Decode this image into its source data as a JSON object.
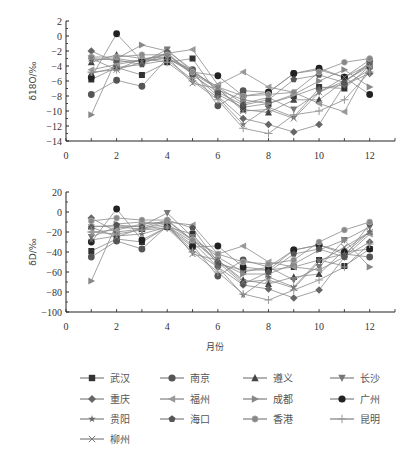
{
  "chart_data": [
    {
      "type": "line",
      "title": "",
      "xlabel": "",
      "ylabel": "δ18O/‰",
      "ylim": [
        -14,
        2
      ],
      "xlim": [
        0,
        13
      ],
      "yticks": [
        2,
        0,
        -2,
        -4,
        -6,
        -8,
        -10,
        -12,
        -14
      ],
      "xticks": [
        0,
        2,
        4,
        6,
        8,
        10,
        12
      ],
      "x": [
        1,
        2,
        3,
        4,
        5,
        6,
        7,
        8,
        9,
        10,
        11,
        12
      ],
      "series": [
        {
          "name": "武汉",
          "marker": "square",
          "color": "#333333",
          "values": [
            -5.8,
            -4.2,
            -5.2,
            -3.5,
            -3.0,
            -7.8,
            -9.5,
            -9.0,
            -8.0,
            -6.8,
            -7.0,
            -4.0
          ]
        },
        {
          "name": "南京",
          "marker": "circle",
          "color": "#555555",
          "values": [
            -7.8,
            -5.9,
            -6.7,
            -3.0,
            -4.5,
            -9.3,
            -7.3,
            -7.5,
            -5.0,
            -4.5,
            -5.5,
            -3.2
          ]
        },
        {
          "name": "遵义",
          "marker": "triangle-up",
          "color": "#444444",
          "values": [
            -3.5,
            -2.5,
            -3.0,
            -2.8,
            -5.0,
            -7.0,
            -9.8,
            -10.2,
            -8.5,
            -8.5,
            -6.0,
            -3.8
          ]
        },
        {
          "name": "长沙",
          "marker": "triangle-down",
          "color": "#777777",
          "values": [
            -3.2,
            -3.0,
            -3.5,
            -1.8,
            -4.8,
            -6.8,
            -9.0,
            -8.2,
            -9.8,
            -7.5,
            -6.0,
            -4.0
          ]
        },
        {
          "name": "重庆",
          "marker": "diamond",
          "color": "#666666",
          "values": [
            -2.0,
            -3.5,
            -3.2,
            -2.5,
            -5.0,
            -8.0,
            -11.0,
            -11.8,
            -12.8,
            -11.8,
            -6.5,
            -5.0
          ]
        },
        {
          "name": "福州",
          "marker": "triangle-left",
          "color": "#999999",
          "values": [
            -4.5,
            -3.8,
            -3.2,
            -2.3,
            -1.8,
            -6.5,
            -4.8,
            -6.8,
            -7.5,
            -9.0,
            -10.1,
            -4.0
          ]
        },
        {
          "name": "成都",
          "marker": "triangle-right",
          "color": "#888888",
          "values": [
            -10.5,
            -3.0,
            -1.2,
            -2.0,
            -4.5,
            -7.2,
            -8.5,
            -9.0,
            -7.8,
            -6.0,
            -4.5,
            -6.8
          ]
        },
        {
          "name": "广州",
          "marker": "circle",
          "color": "#222222",
          "values": [
            -5.5,
            0.3,
            -3.3,
            -3.0,
            -4.8,
            -5.3,
            -8.0,
            -7.5,
            -5.0,
            -4.3,
            -5.5,
            -7.8
          ]
        },
        {
          "name": "贵阳",
          "marker": "star",
          "color": "#666666",
          "values": [
            -5.0,
            -4.2,
            -3.8,
            -3.2,
            -5.8,
            -8.2,
            -11.8,
            -9.5,
            -10.8,
            -7.0,
            -6.5,
            -4.5
          ]
        },
        {
          "name": "海口",
          "marker": "pentagon",
          "color": "#555555",
          "values": [
            -3.0,
            -3.2,
            -3.8,
            -2.2,
            -5.2,
            -7.5,
            -9.2,
            -8.5,
            -5.8,
            -5.2,
            -6.2,
            -3.5
          ]
        },
        {
          "name": "香港",
          "marker": "circle-small",
          "color": "#888888",
          "values": [
            -2.8,
            -2.8,
            -2.5,
            -2.5,
            -4.8,
            -6.8,
            -8.0,
            -7.8,
            -7.5,
            -4.8,
            -3.5,
            -3.0
          ]
        },
        {
          "name": "昆明",
          "marker": "plus",
          "color": "#999999",
          "values": [
            -4.8,
            -4.5,
            -3.0,
            -3.5,
            -6.0,
            -8.5,
            -12.3,
            -13.0,
            -10.5,
            -10.0,
            -8.5,
            -4.8
          ]
        },
        {
          "name": "柳州",
          "marker": "x",
          "color": "#777777",
          "values": [
            -3.0,
            -4.5,
            -3.5,
            -2.8,
            -6.3,
            -7.0,
            -10.0,
            -9.8,
            -11.0,
            -7.5,
            -5.5,
            -3.8
          ]
        }
      ]
    },
    {
      "type": "line",
      "title": "",
      "xlabel": "月份",
      "ylabel": "δD/‰",
      "ylim": [
        -100,
        20
      ],
      "xlim": [
        0,
        13
      ],
      "yticks": [
        20,
        0,
        -20,
        -40,
        -60,
        -80,
        -100
      ],
      "xticks": [
        0,
        2,
        4,
        6,
        8,
        10,
        12
      ],
      "x": [
        1,
        2,
        3,
        4,
        5,
        6,
        7,
        8,
        9,
        10,
        11,
        12
      ],
      "series": [
        {
          "name": "武汉",
          "marker": "square",
          "color": "#333333",
          "values": [
            -39,
            -27,
            -30,
            -15,
            -22,
            -52,
            -58,
            -58,
            -55,
            -48,
            -54,
            -37
          ]
        },
        {
          "name": "南京",
          "marker": "circle",
          "color": "#555555",
          "values": [
            -45,
            -29,
            -37,
            -14,
            -33,
            -64,
            -48,
            -55,
            -38,
            -33,
            -42,
            -45
          ]
        },
        {
          "name": "遵义",
          "marker": "triangle-up",
          "color": "#444444",
          "values": [
            -14,
            -15,
            -17,
            -9,
            -28,
            -48,
            -68,
            -72,
            -65,
            -62,
            -38,
            -20
          ]
        },
        {
          "name": "长沙",
          "marker": "triangle-down",
          "color": "#777777",
          "values": [
            -25,
            -15,
            -14,
            -1,
            -25,
            -45,
            -60,
            -55,
            -68,
            -55,
            -28,
            -15
          ]
        },
        {
          "name": "重庆",
          "marker": "diamond",
          "color": "#666666",
          "values": [
            -6,
            -20,
            -17,
            -14,
            -30,
            -55,
            -73,
            -77,
            -86,
            -78,
            -45,
            -30
          ]
        },
        {
          "name": "福州",
          "marker": "triangle-left",
          "color": "#999999",
          "values": [
            -20,
            -18,
            -12,
            -10,
            -13,
            -42,
            -34,
            -50,
            -55,
            -58,
            -45,
            -22
          ]
        },
        {
          "name": "成都",
          "marker": "triangle-right",
          "color": "#888888",
          "values": [
            -69,
            -12,
            -10,
            -12,
            -28,
            -50,
            -62,
            -62,
            -52,
            -38,
            -28,
            -55
          ]
        },
        {
          "name": "广州",
          "marker": "circle",
          "color": "#222222",
          "values": [
            -30,
            3,
            -28,
            -15,
            -35,
            -34,
            -55,
            -58,
            -38,
            -33,
            -40,
            -37
          ]
        },
        {
          "name": "贵阳",
          "marker": "star",
          "color": "#666666",
          "values": [
            -28,
            -24,
            -22,
            -15,
            -38,
            -55,
            -83,
            -65,
            -75,
            -48,
            -42,
            -20
          ]
        },
        {
          "name": "海口",
          "marker": "pentagon",
          "color": "#555555",
          "values": [
            -15,
            -13,
            -15,
            -8,
            -16,
            -50,
            -72,
            -60,
            -42,
            -37,
            -45,
            -12
          ]
        },
        {
          "name": "香港",
          "marker": "circle-small",
          "color": "#888888",
          "values": [
            -9,
            -6,
            -8,
            -8,
            -28,
            -42,
            -50,
            -52,
            -48,
            -30,
            -18,
            -10
          ]
        },
        {
          "name": "昆明",
          "marker": "plus",
          "color": "#999999",
          "values": [
            -20,
            -22,
            -18,
            -16,
            -40,
            -60,
            -82,
            -88,
            -78,
            -68,
            -55,
            -32
          ]
        },
        {
          "name": "柳州",
          "marker": "x",
          "color": "#777777",
          "values": [
            -15,
            -25,
            -16,
            -12,
            -42,
            -48,
            -70,
            -68,
            -76,
            -50,
            -35,
            -20
          ]
        }
      ]
    }
  ],
  "legend": {
    "items": [
      "武汉",
      "南京",
      "遵义",
      "长沙",
      "重庆",
      "福州",
      "成都",
      "广州",
      "贵阳",
      "海口",
      "香港",
      "昆明",
      "柳州"
    ]
  },
  "labels": {
    "top_ylabel": "δ18O/‰",
    "bottom_ylabel": "δD/‰",
    "xlabel": "月份"
  }
}
